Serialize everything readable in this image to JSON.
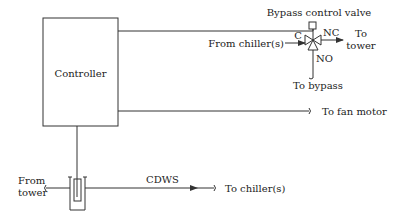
{
  "diagram": {
    "controller": {
      "label": "Controller"
    },
    "valve": {
      "title": "Bypass control valve",
      "port_common": "C",
      "port_nc": "NC",
      "port_no": "NO",
      "inlet_label": "From chiller(s)",
      "outlet_label_line1": "To",
      "outlet_label_line2": "tower",
      "bypass_label": "To bypass"
    },
    "fan": {
      "label": "To fan motor"
    },
    "sensor": {
      "from_label_line1": "From",
      "from_label_line2": "tower",
      "line_label": "CDWS",
      "to_label": "To chiller(s)"
    },
    "colors": {
      "line": "#333333",
      "text": "#222222",
      "background": "#ffffff"
    }
  }
}
